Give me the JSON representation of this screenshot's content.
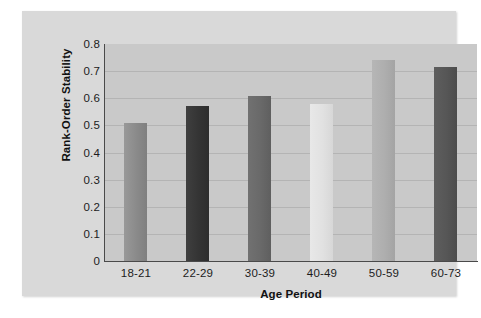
{
  "chart_data": {
    "type": "bar",
    "title": "",
    "xlabel": "Age Period",
    "ylabel": "Rank-Order Stability",
    "categories": [
      "18-21",
      "22-29",
      "30-39",
      "40-49",
      "50-59",
      "60-73"
    ],
    "values": [
      0.51,
      0.57,
      0.61,
      0.58,
      0.74,
      0.715
    ],
    "ylim": [
      0,
      0.8
    ],
    "ytick_labels": [
      "0.8",
      "0.7",
      "0.6",
      "0.5",
      "0.4",
      "0.3",
      "0.2",
      "0.1",
      "0"
    ],
    "ytick_values": [
      0.8,
      0.7,
      0.6,
      0.5,
      0.4,
      0.3,
      0.2,
      0.1,
      0
    ],
    "grid": true,
    "legend": "none",
    "bar_colors": [
      "#8f8f8f",
      "#3a3a3a",
      "#6b6b6b",
      "#e2e2e2",
      "#b0b0b0",
      "#585858"
    ],
    "colors": {
      "page_background": "#ffffff",
      "card_background": "#d9d9d9",
      "plot_background": "#c9c9c9",
      "gridline": "#b4b4b4",
      "axis": "#4a4a4a",
      "text": "#1c1c1c"
    }
  }
}
